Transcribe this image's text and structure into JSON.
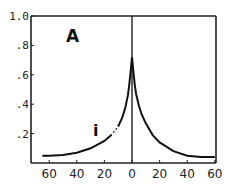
{
  "chart_data": {
    "type": "line",
    "title": "",
    "panel_label": "A",
    "annotation": "i",
    "xlabel": "",
    "ylabel": "",
    "xlim": [
      -65,
      60
    ],
    "ylim": [
      0,
      1.0
    ],
    "grid": false,
    "legend": null,
    "x_ticks": [
      -60,
      -40,
      -20,
      0,
      20,
      40,
      60
    ],
    "x_tick_labels": [
      "60",
      "40",
      "20",
      "0",
      "20",
      "40",
      "60"
    ],
    "y_ticks": [
      0.2,
      0.4,
      0.6,
      0.8,
      1.0
    ],
    "y_tick_labels": [
      ".2",
      ".4",
      ".6",
      ".8",
      "1.0"
    ],
    "vertical_line_at_x": 0,
    "series": [
      {
        "name": "curve",
        "x": [
          -65,
          -60,
          -50,
          -40,
          -30,
          -20,
          -15,
          -10,
          -7,
          -5,
          -3,
          -2,
          -1,
          0,
          1,
          2,
          3,
          5,
          7,
          10,
          15,
          20,
          30,
          40,
          50,
          60
        ],
        "y": [
          0.05,
          0.05,
          0.055,
          0.07,
          0.1,
          0.15,
          0.19,
          0.25,
          0.31,
          0.37,
          0.46,
          0.53,
          0.62,
          0.72,
          0.62,
          0.53,
          0.47,
          0.39,
          0.33,
          0.27,
          0.19,
          0.14,
          0.08,
          0.05,
          0.04,
          0.04
        ]
      }
    ],
    "dashed_segment_x": [
      -17,
      -10
    ]
  }
}
